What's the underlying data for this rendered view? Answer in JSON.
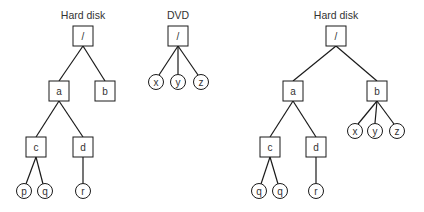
{
  "trees": [
    {
      "id": "left-hard-disk",
      "title": "Hard disk",
      "title_pos": [
        83,
        19
      ],
      "nodes": [
        {
          "id": "root",
          "label": "/",
          "shape": "box",
          "x": 83,
          "y": 36
        },
        {
          "id": "a",
          "label": "a",
          "shape": "box",
          "x": 59,
          "y": 91
        },
        {
          "id": "b",
          "label": "b",
          "shape": "box",
          "x": 105,
          "y": 91
        },
        {
          "id": "c",
          "label": "c",
          "shape": "box",
          "x": 36,
          "y": 147
        },
        {
          "id": "d",
          "label": "d",
          "shape": "box",
          "x": 83,
          "y": 147
        },
        {
          "id": "p",
          "label": "p",
          "shape": "circle",
          "x": 24,
          "y": 191
        },
        {
          "id": "q",
          "label": "q",
          "shape": "circle",
          "x": 45,
          "y": 191
        },
        {
          "id": "r",
          "label": "r",
          "shape": "circle",
          "x": 83,
          "y": 191
        }
      ]
    },
    {
      "id": "dvd",
      "title": "DVD",
      "title_pos": [
        178,
        19
      ],
      "nodes": [
        {
          "id": "root",
          "label": "/",
          "shape": "box",
          "x": 178,
          "y": 36
        },
        {
          "id": "x",
          "label": "x",
          "shape": "circle",
          "x": 156,
          "y": 82
        },
        {
          "id": "y",
          "label": "y",
          "shape": "circle",
          "x": 178,
          "y": 82
        },
        {
          "id": "z",
          "label": "z",
          "shape": "circle",
          "x": 201,
          "y": 82
        }
      ]
    },
    {
      "id": "right-hard-disk-mounted",
      "title": "Hard disk",
      "title_pos": [
        336,
        19
      ],
      "nodes": [
        {
          "id": "root",
          "label": "/",
          "shape": "box",
          "x": 336,
          "y": 36
        },
        {
          "id": "a",
          "label": "a",
          "shape": "box",
          "x": 293,
          "y": 91
        },
        {
          "id": "b",
          "label": "b",
          "shape": "box",
          "x": 377,
          "y": 91
        },
        {
          "id": "x",
          "label": "x",
          "shape": "circle",
          "x": 355,
          "y": 131
        },
        {
          "id": "y",
          "label": "y",
          "shape": "circle",
          "x": 375,
          "y": 131
        },
        {
          "id": "z",
          "label": "z",
          "shape": "circle",
          "x": 397,
          "y": 131
        },
        {
          "id": "c",
          "label": "c",
          "shape": "box",
          "x": 270,
          "y": 147
        },
        {
          "id": "d",
          "label": "d",
          "shape": "box",
          "x": 316,
          "y": 147
        },
        {
          "id": "q1",
          "label": "q",
          "shape": "circle",
          "x": 259,
          "y": 191
        },
        {
          "id": "q2",
          "label": "q",
          "shape": "circle",
          "x": 280,
          "y": 191
        },
        {
          "id": "r",
          "label": "r",
          "shape": "circle",
          "x": 316,
          "y": 191
        }
      ]
    }
  ],
  "edges": [
    [
      83,
      46,
      59,
      81
    ],
    [
      83,
      46,
      105,
      81
    ],
    [
      59,
      101,
      36,
      137
    ],
    [
      59,
      101,
      83,
      137
    ],
    [
      36,
      157,
      26,
      184
    ],
    [
      36,
      157,
      43,
      184
    ],
    [
      83,
      157,
      83,
      183
    ],
    [
      178,
      46,
      159,
      75
    ],
    [
      178,
      46,
      178,
      74
    ],
    [
      178,
      46,
      198,
      75
    ],
    [
      336,
      46,
      293,
      81
    ],
    [
      336,
      46,
      377,
      81
    ],
    [
      293,
      101,
      270,
      137
    ],
    [
      293,
      101,
      316,
      137
    ],
    [
      270,
      157,
      261,
      184
    ],
    [
      270,
      157,
      278,
      184
    ],
    [
      316,
      157,
      316,
      183
    ],
    [
      377,
      101,
      358,
      124
    ],
    [
      377,
      101,
      375,
      123
    ],
    [
      377,
      101,
      394,
      124
    ]
  ],
  "style": {
    "line_color": "#1a1a1a",
    "text_color": "#333333",
    "background": "#ffffff",
    "box_size": 20,
    "circle_radius": 7.5
  }
}
